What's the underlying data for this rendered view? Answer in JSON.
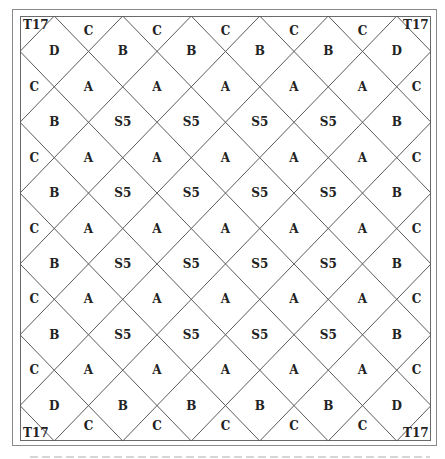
{
  "diagram": {
    "type": "quilt-layout",
    "frame": {
      "outer": {
        "x": 12,
        "y": 9,
        "w": 425,
        "h": 437
      },
      "inner": {
        "x": 20,
        "y": 16,
        "w": 411,
        "h": 425
      }
    },
    "lattice": {
      "half_steps_x": 12,
      "half_steps_y": 12,
      "line_color": "#5a5a5a"
    },
    "corners": {
      "top_left": "T17",
      "top_right": "T17",
      "bottom_left": "T17",
      "bottom_right": "T17"
    },
    "rows": [
      {
        "j": 0.42,
        "cells": [
          {
            "i": 2,
            "t": "C"
          },
          {
            "i": 4,
            "t": "C"
          },
          {
            "i": 6,
            "t": "C"
          },
          {
            "i": 8,
            "t": "C"
          },
          {
            "i": 10,
            "t": "C"
          }
        ]
      },
      {
        "j": 1,
        "cells": [
          {
            "i": 1,
            "t": "D"
          },
          {
            "i": 3,
            "t": "B"
          },
          {
            "i": 5,
            "t": "B"
          },
          {
            "i": 7,
            "t": "B"
          },
          {
            "i": 9,
            "t": "B"
          },
          {
            "i": 11,
            "t": "D"
          }
        ]
      },
      {
        "j": 2,
        "cells": [
          {
            "i": 0.42,
            "t": "C"
          },
          {
            "i": 2,
            "t": "A"
          },
          {
            "i": 4,
            "t": "A"
          },
          {
            "i": 6,
            "t": "A"
          },
          {
            "i": 8,
            "t": "A"
          },
          {
            "i": 10,
            "t": "A"
          },
          {
            "i": 11.58,
            "t": "C"
          }
        ]
      },
      {
        "j": 3,
        "cells": [
          {
            "i": 1,
            "t": "B"
          },
          {
            "i": 3,
            "t": "S5"
          },
          {
            "i": 5,
            "t": "S5"
          },
          {
            "i": 7,
            "t": "S5"
          },
          {
            "i": 9,
            "t": "S5"
          },
          {
            "i": 11,
            "t": "B"
          }
        ]
      },
      {
        "j": 4,
        "cells": [
          {
            "i": 0.42,
            "t": "C"
          },
          {
            "i": 2,
            "t": "A"
          },
          {
            "i": 4,
            "t": "A"
          },
          {
            "i": 6,
            "t": "A"
          },
          {
            "i": 8,
            "t": "A"
          },
          {
            "i": 10,
            "t": "A"
          },
          {
            "i": 11.58,
            "t": "C"
          }
        ]
      },
      {
        "j": 5,
        "cells": [
          {
            "i": 1,
            "t": "B"
          },
          {
            "i": 3,
            "t": "S5"
          },
          {
            "i": 5,
            "t": "S5"
          },
          {
            "i": 7,
            "t": "S5"
          },
          {
            "i": 9,
            "t": "S5"
          },
          {
            "i": 11,
            "t": "B"
          }
        ]
      },
      {
        "j": 6,
        "cells": [
          {
            "i": 0.42,
            "t": "C"
          },
          {
            "i": 2,
            "t": "A"
          },
          {
            "i": 4,
            "t": "A"
          },
          {
            "i": 6,
            "t": "A"
          },
          {
            "i": 8,
            "t": "A"
          },
          {
            "i": 10,
            "t": "A"
          },
          {
            "i": 11.58,
            "t": "C"
          }
        ]
      },
      {
        "j": 7,
        "cells": [
          {
            "i": 1,
            "t": "B"
          },
          {
            "i": 3,
            "t": "S5"
          },
          {
            "i": 5,
            "t": "S5"
          },
          {
            "i": 7,
            "t": "S5"
          },
          {
            "i": 9,
            "t": "S5"
          },
          {
            "i": 11,
            "t": "B"
          }
        ]
      },
      {
        "j": 8,
        "cells": [
          {
            "i": 0.42,
            "t": "C"
          },
          {
            "i": 2,
            "t": "A"
          },
          {
            "i": 4,
            "t": "A"
          },
          {
            "i": 6,
            "t": "A"
          },
          {
            "i": 8,
            "t": "A"
          },
          {
            "i": 10,
            "t": "A"
          },
          {
            "i": 11.58,
            "t": "C"
          }
        ]
      },
      {
        "j": 9,
        "cells": [
          {
            "i": 1,
            "t": "B"
          },
          {
            "i": 3,
            "t": "S5"
          },
          {
            "i": 5,
            "t": "S5"
          },
          {
            "i": 7,
            "t": "S5"
          },
          {
            "i": 9,
            "t": "S5"
          },
          {
            "i": 11,
            "t": "B"
          }
        ]
      },
      {
        "j": 10,
        "cells": [
          {
            "i": 0.42,
            "t": "C"
          },
          {
            "i": 2,
            "t": "A"
          },
          {
            "i": 4,
            "t": "A"
          },
          {
            "i": 6,
            "t": "A"
          },
          {
            "i": 8,
            "t": "A"
          },
          {
            "i": 10,
            "t": "A"
          },
          {
            "i": 11.58,
            "t": "C"
          }
        ]
      },
      {
        "j": 11,
        "cells": [
          {
            "i": 1,
            "t": "D"
          },
          {
            "i": 3,
            "t": "B"
          },
          {
            "i": 5,
            "t": "B"
          },
          {
            "i": 7,
            "t": "B"
          },
          {
            "i": 9,
            "t": "B"
          },
          {
            "i": 11,
            "t": "D"
          }
        ]
      },
      {
        "j": 11.58,
        "cells": [
          {
            "i": 2,
            "t": "C"
          },
          {
            "i": 4,
            "t": "C"
          },
          {
            "i": 6,
            "t": "C"
          },
          {
            "i": 8,
            "t": "C"
          },
          {
            "i": 10,
            "t": "C"
          }
        ]
      }
    ],
    "legend": {
      "A": "interior square block",
      "S5": "center square block",
      "B": "border block",
      "C": "side setting triangle",
      "D": "corner-adjacent block",
      "T17": "corner triangle"
    }
  }
}
